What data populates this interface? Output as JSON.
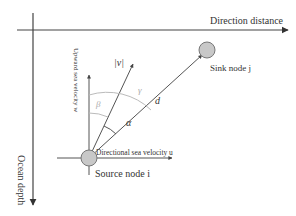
{
  "diagram": {
    "axes": {
      "horizontal_label": "Direction distance",
      "vertical_label": "Ocean depth"
    },
    "vectors": {
      "upward_label": "Upward sea velocity w",
      "directional_label": "Directional sea velocity u",
      "velocity_label": "|v|",
      "distance_label": "d"
    },
    "angles": {
      "alpha": "α",
      "beta": "β",
      "gamma": "γ"
    },
    "nodes": {
      "source": "Source node i",
      "sink": "Sink node j"
    },
    "colors": {
      "line": "#555555",
      "angle_arc_light": "#b8b8b8",
      "node_fill": "#c8c8c8",
      "node_stroke": "#777777"
    }
  }
}
